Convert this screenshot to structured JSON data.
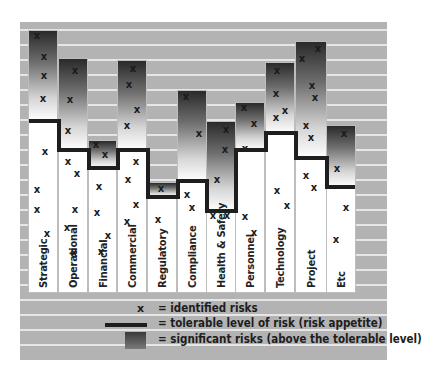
{
  "chart_data": {
    "type": "bar",
    "title": "",
    "xlabel": "",
    "ylabel": "",
    "categories": [
      "Strategic",
      "Operational",
      "Financial",
      "Commercial",
      "Regulatory",
      "Compliance",
      "Health & Safety",
      "Personnel",
      "Technology",
      "Project",
      "Etc"
    ],
    "series": [
      {
        "name": "total risk level (bar top)",
        "values": [
          88,
          78,
          50,
          77,
          37,
          67,
          57,
          63,
          76,
          83,
          56
        ]
      },
      {
        "name": "tolerable level of risk (risk appetite)",
        "values": [
          58,
          48,
          42,
          48,
          32,
          38,
          28,
          48,
          54,
          45,
          36
        ]
      },
      {
        "name": "identified risks (count of x marks)",
        "values": [
          7,
          8,
          7,
          8,
          3,
          4,
          5,
          4,
          6,
          7,
          5
        ]
      }
    ],
    "grid": true,
    "legend_position": "bottom",
    "ylim": [
      0,
      100
    ],
    "annotations": [
      "x marks denote individual identified risks within each category"
    ]
  },
  "geometry": {
    "bottom": 292,
    "columns": [
      {
        "x": 29,
        "w": 28,
        "top": 31,
        "tol": 121,
        "marks": [
          [
            37,
            36
          ],
          [
            44,
            57
          ],
          [
            44,
            76
          ],
          [
            43,
            99
          ],
          [
            45,
            152
          ],
          [
            37,
            190
          ],
          [
            37,
            210
          ],
          [
            47,
            234
          ]
        ]
      },
      {
        "x": 59,
        "w": 28,
        "top": 59,
        "tol": 150,
        "marks": [
          [
            75,
            71
          ],
          [
            70,
            100
          ],
          [
            68,
            131
          ],
          [
            68,
            162
          ],
          [
            77,
            174
          ],
          [
            75,
            210
          ],
          [
            67,
            228
          ],
          [
            74,
            253
          ]
        ]
      },
      {
        "x": 89,
        "w": 27,
        "top": 141,
        "tol": 168,
        "marks": [
          [
            96,
            145
          ],
          [
            105,
            155
          ],
          [
            99,
            187
          ],
          [
            97,
            213
          ],
          [
            108,
            236
          ],
          [
            101,
            252
          ]
        ]
      },
      {
        "x": 118,
        "w": 28,
        "top": 61,
        "tol": 150,
        "marks": [
          [
            133,
            69
          ],
          [
            129,
            85
          ],
          [
            137,
            110
          ],
          [
            127,
            126
          ],
          [
            136,
            162
          ],
          [
            128,
            180
          ],
          [
            136,
            205
          ],
          [
            127,
            222
          ]
        ]
      },
      {
        "x": 148,
        "w": 28,
        "top": 183,
        "tol": 197,
        "marks": [
          [
            161,
            189
          ],
          [
            158,
            220
          ]
        ]
      },
      {
        "x": 178,
        "w": 28,
        "top": 91,
        "tol": 181,
        "marks": [
          [
            186,
            97
          ],
          [
            199,
            134
          ],
          [
            187,
            195
          ],
          [
            192,
            208
          ]
        ]
      },
      {
        "x": 207,
        "w": 28,
        "top": 122,
        "tol": 211,
        "marks": [
          [
            226,
            130
          ],
          [
            225,
            150
          ],
          [
            217,
            180
          ],
          [
            213,
            216
          ],
          [
            227,
            216
          ]
        ]
      },
      {
        "x": 236,
        "w": 28,
        "top": 103,
        "tol": 150,
        "marks": [
          [
            244,
            108
          ],
          [
            254,
            124
          ],
          [
            245,
            149
          ],
          [
            245,
            217
          ],
          [
            254,
            233
          ]
        ]
      },
      {
        "x": 266,
        "w": 28,
        "top": 63,
        "tol": 133,
        "marks": [
          [
            277,
            71
          ],
          [
            276,
            94
          ],
          [
            276,
            118
          ],
          [
            285,
            111
          ],
          [
            277,
            191
          ],
          [
            287,
            206
          ]
        ]
      },
      {
        "x": 296,
        "w": 30,
        "top": 42,
        "tol": 158,
        "marks": [
          [
            318,
            49
          ],
          [
            302,
            59
          ],
          [
            312,
            86
          ],
          [
            315,
            98
          ],
          [
            306,
            126
          ],
          [
            311,
            138
          ],
          [
            306,
            176
          ],
          [
            314,
            188
          ]
        ]
      },
      {
        "x": 327,
        "w": 28,
        "top": 126,
        "tol": 187,
        "marks": [
          [
            344,
            134
          ],
          [
            337,
            169
          ],
          [
            346,
            208
          ],
          [
            336,
            240
          ]
        ]
      }
    ],
    "stripes": [
      29,
      44,
      59,
      74,
      89,
      104,
      119,
      134,
      149,
      164,
      179,
      194,
      209,
      224,
      239,
      254,
      269,
      284,
      299,
      314,
      329,
      344
    ]
  },
  "legend": {
    "items": [
      {
        "symbol": "x",
        "label": "= identified risks"
      },
      {
        "symbol": "line",
        "label": "= tolerable level of risk (risk appetite)"
      },
      {
        "symbol": "swatch",
        "label": "= significant risks (above the tolerable level)"
      }
    ]
  },
  "colors": {
    "panel": "#b3b3b3",
    "stripe": "#e6e6e6",
    "bar": "#ffffff",
    "tolerance_line": "#1e1e1e",
    "significant_gradient_top": "#2a2a2a"
  }
}
